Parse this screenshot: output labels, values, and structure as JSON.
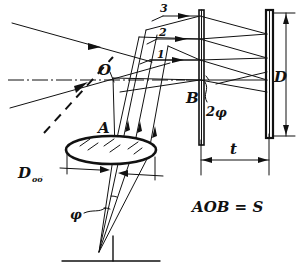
{
  "figure": {
    "ink_color": "#111111",
    "background_color": "#ffffff",
    "formula": "AOB = S",
    "labels": {
      "point_o": "O",
      "point_a": "A",
      "point_b": "B",
      "screen_height": "D",
      "objective_diameter": "D",
      "objective_diameter_subscript": "об",
      "gap_thickness": "t",
      "half_angle": "φ",
      "full_angle_prefix": "2",
      "full_angle": "φ"
    },
    "ray_numbers": [
      {
        "id": "ray-3",
        "label": "3"
      },
      {
        "id": "ray-2",
        "label": "2"
      },
      {
        "id": "ray-1",
        "label": "1"
      }
    ],
    "elements": [
      {
        "id": "objective-lens",
        "label": "A",
        "kind": "lens"
      },
      {
        "id": "plate-b",
        "label": "B",
        "kind": "plate"
      },
      {
        "id": "screen-d",
        "label": "D",
        "kind": "screen"
      },
      {
        "id": "axis-point-o",
        "label": "O",
        "kind": "axis-point"
      }
    ],
    "dimensions": [
      {
        "id": "dim-objective",
        "label": "D",
        "sub": "об"
      },
      {
        "id": "dim-gap",
        "label": "t"
      },
      {
        "id": "dim-screen",
        "label": "D"
      }
    ]
  }
}
